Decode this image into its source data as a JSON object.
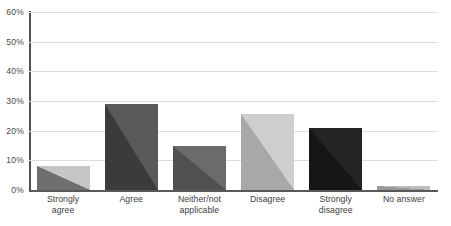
{
  "chart_data": {
    "type": "bar",
    "title": "Parents' view of homework usefulness",
    "xlabel": "",
    "ylabel": "",
    "ylim": [
      0,
      60
    ],
    "yticks": [
      "0%",
      "10%",
      "20%",
      "30%",
      "40%",
      "50%",
      "60%"
    ],
    "ytick_values": [
      0,
      10,
      20,
      30,
      40,
      50,
      60
    ],
    "grid": true,
    "legend": "none",
    "categories": [
      "Strongly agree",
      "Agree",
      "Neither/not applicable",
      "Disagree",
      "Strongly disagree",
      "No answer"
    ],
    "values": [
      8.05,
      29.13,
      14.9,
      25.6,
      21.02,
      1.3
    ],
    "counts": [
      383,
      1386,
      709,
      1218,
      1000,
      62
    ],
    "point_labels": [
      {
        "pct": "8.05%",
        "count": "(383)"
      },
      {
        "pct": "29.13%",
        "count": "(1,386)"
      },
      {
        "pct": "14.90%",
        "count": "(709)"
      },
      {
        "pct": "25.60%",
        "count": "(1,218)"
      },
      {
        "pct": "21.02%",
        "count": "(1,000)"
      },
      {
        "pct": "1.30%",
        "count": "(62)"
      }
    ],
    "bar_colors_dark": [
      "#6e6f71",
      "#3a3b3d",
      "#4f5052",
      "#a7a8aa",
      "#161617",
      "#97989a"
    ],
    "bar_colors_light": [
      "#c4c5c7",
      "#58595b",
      "#6a6b6d",
      "#cdced0",
      "#232425",
      "#bcbdbf"
    ],
    "axis_color": "#4f5052",
    "grid_color": "#dddddd",
    "background": "#ffffff"
  },
  "cat_labels": [
    {
      "line1": "Strongly",
      "line2": "agree"
    },
    {
      "line1": "Agree",
      "line2": ""
    },
    {
      "line1": "Neither/not",
      "line2": "applicable"
    },
    {
      "line1": "Disagree",
      "line2": ""
    },
    {
      "line1": "Strongly",
      "line2": "disagree"
    },
    {
      "line1": "No answer",
      "line2": ""
    }
  ]
}
